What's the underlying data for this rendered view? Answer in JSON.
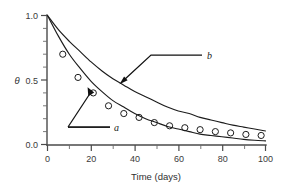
{
  "chart_data": {
    "type": "line",
    "title": "",
    "subtitle": "",
    "xlabel": "Time (days)",
    "ylabel": "θ",
    "xlim": [
      0,
      100
    ],
    "ylim": [
      0.0,
      1.0
    ],
    "grid": false,
    "legend_position": "inline-annotations",
    "x_ticks": [
      0,
      20,
      40,
      60,
      80,
      100
    ],
    "x_tick_labels": [
      "0",
      "20",
      "40",
      "60",
      "80",
      "100"
    ],
    "x_minor_ticks": [
      10,
      30,
      50,
      70,
      90
    ],
    "y_ticks": [
      0.0,
      0.5,
      1.0
    ],
    "y_tick_labels": [
      "0.0",
      "0.5",
      "1.0"
    ],
    "y_minor_ticks": [
      0.1,
      0.2,
      0.3,
      0.4,
      0.6,
      0.7,
      0.8,
      0.9
    ],
    "annotations": [
      {
        "text": "a",
        "target_x": 21,
        "target_y": 0.41
      },
      {
        "text": "b",
        "target_x": 38,
        "target_y": 0.45
      }
    ],
    "series": [
      {
        "name": "a",
        "label": "a",
        "style": "solid-line",
        "color": "#1c1c1c",
        "x": [
          0,
          5,
          10,
          15,
          20,
          25,
          30,
          35,
          40,
          45,
          50,
          55,
          60,
          65,
          70,
          75,
          80,
          85,
          90,
          95,
          100
        ],
        "values": [
          1.0,
          0.84,
          0.7,
          0.59,
          0.49,
          0.41,
          0.34,
          0.29,
          0.24,
          0.2,
          0.17,
          0.14,
          0.12,
          0.1,
          0.08,
          0.07,
          0.06,
          0.05,
          0.04,
          0.033,
          0.028
        ]
      },
      {
        "name": "b",
        "label": "b",
        "style": "solid-line",
        "color": "#1c1c1c",
        "x": [
          0,
          5,
          10,
          15,
          20,
          25,
          30,
          35,
          40,
          45,
          50,
          55,
          60,
          65,
          70,
          75,
          80,
          85,
          90,
          95,
          100
        ],
        "values": [
          1.0,
          0.89,
          0.8,
          0.72,
          0.64,
          0.57,
          0.51,
          0.46,
          0.41,
          0.37,
          0.33,
          0.29,
          0.26,
          0.24,
          0.21,
          0.19,
          0.17,
          0.15,
          0.135,
          0.12,
          0.105
        ]
      },
      {
        "name": "measured",
        "label": "",
        "style": "open-circle-markers",
        "color": "#1c1c1c",
        "x": [
          7,
          14,
          21,
          28,
          35,
          42,
          49,
          56,
          63,
          70,
          77,
          84,
          91,
          98
        ],
        "values": [
          0.7,
          0.52,
          0.4,
          0.3,
          0.24,
          0.21,
          0.17,
          0.145,
          0.13,
          0.115,
          0.1,
          0.09,
          0.078,
          0.07
        ]
      }
    ]
  },
  "figure": {
    "background_color": "#ffffff",
    "axis_color": "#4a4a4a",
    "curve_color": "#1c1c1c",
    "annotation_color": "#111111"
  }
}
